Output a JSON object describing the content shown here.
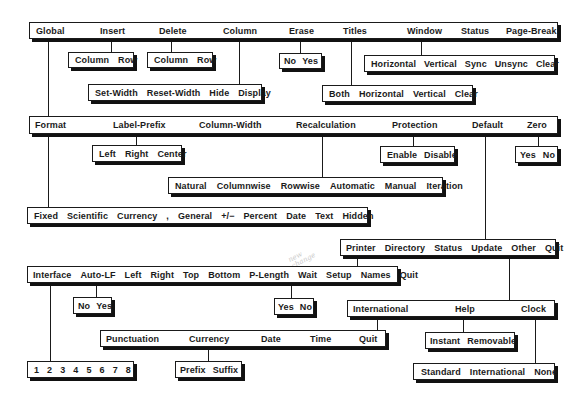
{
  "diagram": {
    "top_menu": {
      "items": [
        "Global",
        "Insert",
        "Delete",
        "Column",
        "Erase",
        "Titles",
        "Window",
        "Status",
        "Page-Break"
      ]
    },
    "insert_menu": {
      "items": [
        "Column",
        "Row"
      ]
    },
    "delete_menu": {
      "items": [
        "Column",
        "Row"
      ]
    },
    "erase_menu": {
      "items": [
        "No",
        "Yes"
      ]
    },
    "window_menu": {
      "items": [
        "Horizontal",
        "Vertical",
        "Sync",
        "Unsync",
        "Clear"
      ]
    },
    "column_menu": {
      "items": [
        "Set-Width",
        "Reset-Width",
        "Hide",
        "Display"
      ]
    },
    "titles_menu": {
      "items": [
        "Both",
        "Horizontal",
        "Vertical",
        "Clear"
      ]
    },
    "global_menu": {
      "items": [
        "Format",
        "Label-Prefix",
        "Column-Width",
        "Recalculation",
        "Protection",
        "Default",
        "Zero"
      ]
    },
    "label_prefix_menu": {
      "items": [
        "Left",
        "Right",
        "Center"
      ]
    },
    "protection_menu": {
      "items": [
        "Enable",
        "Disable"
      ]
    },
    "zero_menu": {
      "items": [
        "Yes",
        "No"
      ]
    },
    "recalculation_menu": {
      "items": [
        "Natural",
        "Columnwise",
        "Rowwise",
        "Automatic",
        "Manual",
        "Iteration"
      ]
    },
    "format_menu": {
      "items": [
        "Fixed",
        "Scientific",
        "Currency",
        ",",
        "General",
        "+/−",
        "Percent",
        "Date",
        "Text",
        "Hidden"
      ]
    },
    "default_menu": {
      "items": [
        "Printer",
        "Directory",
        "Status",
        "Update",
        "Other",
        "Quit"
      ]
    },
    "printer_menu": {
      "items": [
        "Interface",
        "Auto-LF",
        "Left",
        "Right",
        "Top",
        "Bottom",
        "P-Length",
        "Wait",
        "Setup",
        "Names",
        "Quit"
      ]
    },
    "auto_lf_menu": {
      "items": [
        "No",
        "Yes"
      ]
    },
    "wait_menu": {
      "items": [
        "Yes",
        "No"
      ]
    },
    "other_menu": {
      "items": [
        "International",
        "Help",
        "Clock"
      ]
    },
    "international_menu": {
      "items": [
        "Punctuation",
        "Currency",
        "Date",
        "Time",
        "Quit"
      ]
    },
    "help_menu": {
      "items": [
        "Instant",
        "Removable"
      ]
    },
    "interface_menu": {
      "items": [
        "1",
        "2",
        "3",
        "4",
        "5",
        "6",
        "7",
        "8"
      ]
    },
    "currency_menu": {
      "items": [
        "Prefix",
        "Suffix"
      ]
    },
    "clock_menu": {
      "items": [
        "Standard",
        "International",
        "None"
      ]
    },
    "handwritten_note": "new change"
  }
}
